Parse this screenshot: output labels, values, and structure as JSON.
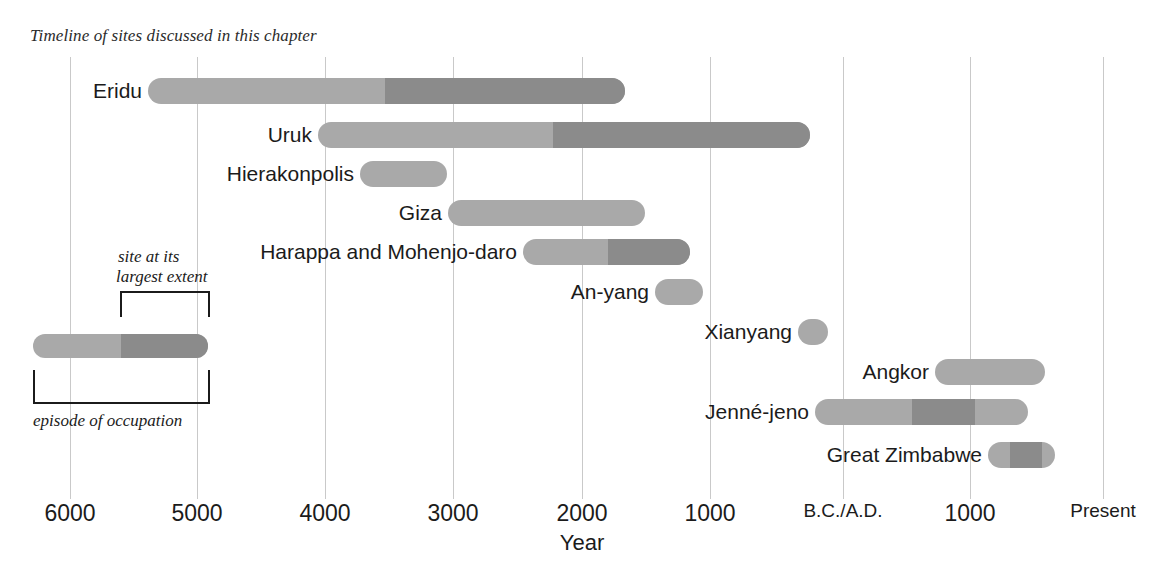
{
  "caption": "Timeline of sites discussed in this chapter",
  "axis": {
    "title": "Year",
    "ticks": [
      {
        "label": "6000",
        "x": 70,
        "small": false
      },
      {
        "label": "5000",
        "x": 197,
        "small": false
      },
      {
        "label": "4000",
        "x": 325,
        "small": false
      },
      {
        "label": "3000",
        "x": 453,
        "small": false
      },
      {
        "label": "2000",
        "x": 582,
        "small": false
      },
      {
        "label": "1000",
        "x": 710,
        "small": false
      },
      {
        "label": "B.C./A.D.",
        "x": 843,
        "small": true
      },
      {
        "label": "1000",
        "x": 970,
        "small": false
      },
      {
        "label": "Present",
        "x": 1103,
        "small": true
      }
    ]
  },
  "legend": {
    "top_label_line1": "site at its",
    "top_label_line2": "largest extent",
    "bottom_label": "episode of occupation"
  },
  "colors": {
    "occupation": "#a9a9a9",
    "largest_extent": "#8b8b8b",
    "gridline": "#c9c9c9",
    "text": "#1b1b1b",
    "background": "#ffffff"
  },
  "chart_data": {
    "type": "bar",
    "title": "Timeline of sites discussed in this chapter",
    "xlabel": "Year",
    "ylabel": "",
    "orientation": "horizontal",
    "grid": true,
    "legend_position": "lower-left",
    "axis_direction": "B.C. decreasing left-to-right, then A.D. increasing",
    "xtick_labels": [
      "6000",
      "5000",
      "4000",
      "3000",
      "2000",
      "1000",
      "B.C./A.D.",
      "1000",
      "Present"
    ],
    "xtick_values_bce_ce": [
      -6000,
      -5000,
      -4000,
      -3000,
      -2000,
      -1000,
      0,
      1000,
      2050
    ],
    "series": [
      {
        "name": "episode of occupation",
        "color": "#a9a9a9"
      },
      {
        "name": "site at its largest extent",
        "color": "#8b8b8b"
      }
    ],
    "categories": [
      "Eridu",
      "Uruk",
      "Hierakonpolis",
      "Giza",
      "Harappa and Mohenjo-daro",
      "An-yang",
      "Xianyang",
      "Angkor",
      "Jenné-jeno",
      "Great Zimbabwe"
    ],
    "bars": [
      {
        "label": "Eridu",
        "row_y": 91,
        "x_start": 148,
        "x_end": 625,
        "dark_start": 385,
        "dark_end": 625,
        "occupation_start_year": -5400,
        "occupation_end_year": -1680,
        "largest_extent_start_year": -3470,
        "largest_extent_end_year": -1680,
        "label_x_right": 142
      },
      {
        "label": "Uruk",
        "row_y": 135,
        "x_start": 318,
        "x_end": 810,
        "dark_start": 553,
        "dark_end": 810,
        "occupation_start_year": -4070,
        "occupation_end_year": -230,
        "largest_extent_start_year": -2230,
        "largest_extent_end_year": -230,
        "label_x_right": 312
      },
      {
        "label": "Hierakonpolis",
        "row_y": 174,
        "x_start": 360,
        "x_end": 447,
        "dark_start": null,
        "dark_end": null,
        "occupation_start_year": -3740,
        "occubation_end_year": -3060,
        "occupation_end_year": -3060,
        "largest_extent_start_year": null,
        "largest_extent_end_year": null,
        "label_x_right": 354
      },
      {
        "label": "Giza",
        "row_y": 213,
        "x_start": 448,
        "x_end": 645,
        "dark_start": null,
        "dark_end": null,
        "occupation_start_year": -3050,
        "occupation_end_year": -1520,
        "largest_extent_start_year": null,
        "largest_extent_end_year": null,
        "label_x_right": 442
      },
      {
        "label": "Harappa and Mohenjo-daro",
        "row_y": 252,
        "x_start": 523,
        "x_end": 690,
        "dark_start": 608,
        "dark_end": 690,
        "occupation_start_year": -2460,
        "occupation_end_year": -1160,
        "largest_extent_start_year": -1800,
        "largest_extent_end_year": -1160,
        "label_x_right": 517
      },
      {
        "label": "An-yang",
        "row_y": 292,
        "x_start": 655,
        "x_end": 703,
        "dark_start": null,
        "dark_end": null,
        "occupation_start_year": -1430,
        "occupation_end_year": -1060,
        "largest_extent_start_year": null,
        "largest_extent_end_year": null,
        "label_x_right": 649
      },
      {
        "label": "Xianyang",
        "row_y": 332,
        "x_start": 798,
        "x_end": 828,
        "dark_start": null,
        "dark_end": null,
        "occupation_start_year": -350,
        "occupation_end_year": -115,
        "largest_extent_start_year": null,
        "largest_extent_end_year": null,
        "label_x_right": 792
      },
      {
        "label": "Angkor",
        "row_y": 372,
        "x_start": 935,
        "x_end": 1045,
        "dark_start": null,
        "dark_end": null,
        "occupation_start_year": 720,
        "occupation_end_year": 1580,
        "largest_extent_start_year": null,
        "largest_extent_end_year": null,
        "label_x_right": 929
      },
      {
        "label": "Jenné-jeno",
        "row_y": 412,
        "x_start": 815,
        "x_end": 1028,
        "dark_start": 912,
        "dark_end": 975,
        "occupation_start_year": -220,
        "occupation_end_year": 1450,
        "largest_extent_start_year": 540,
        "largest_extent_end_year": 1030,
        "label_x_right": 809
      },
      {
        "label": "Great Zimbabwe",
        "row_y": 455,
        "x_start": 988,
        "x_end": 1055,
        "dark_start": 1010,
        "dark_end": 1042,
        "occupation_start_year": 1140,
        "occupation_end_year": 1660,
        "largest_extent_start_year": 1310,
        "largest_extent_end_year": 1560,
        "label_x_right": 982
      }
    ]
  }
}
